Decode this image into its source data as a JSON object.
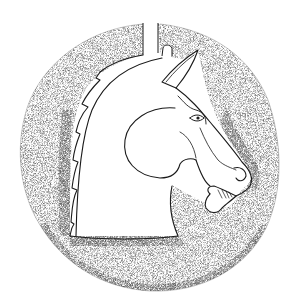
{
  "figure": {
    "style": "line drawing with stippled shading",
    "colors": {
      "background": "#ffffff",
      "ink": "#1a1a1a",
      "stipple": "#3a3a3a"
    }
  }
}
